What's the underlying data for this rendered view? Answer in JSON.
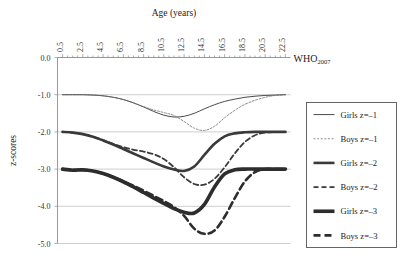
{
  "chart_data": {
    "type": "line",
    "title": "",
    "xlabel": "Age (years)",
    "ylabel": "z-scores",
    "annotation": "WHO",
    "annotation_sub": "2007",
    "xlim": [
      0,
      23
    ],
    "ylim": [
      -5.0,
      0.0
    ],
    "grid": true,
    "legend_position": "right",
    "xticklabels": [
      "0.5",
      "2.5",
      "4.5",
      "6.5",
      "8.5",
      "10.5",
      "12.5",
      "14.5",
      "16.5",
      "18.5",
      "20.5",
      "22.5"
    ],
    "xtickvalues": [
      0.5,
      2.5,
      4.5,
      6.5,
      8.5,
      10.5,
      12.5,
      14.5,
      16.5,
      18.5,
      20.5,
      22.5
    ],
    "yticklabels": [
      "0.0",
      "-1.0",
      "-2.0",
      "-3.0",
      "-4.0",
      "-5.0"
    ],
    "ytickvalues": [
      0.0,
      -1.0,
      -2.0,
      -3.0,
      -4.0,
      -5.0
    ],
    "x": [
      0.5,
      1.5,
      2.5,
      3.5,
      4.5,
      5.5,
      6.5,
      7.5,
      8.5,
      9.5,
      10.5,
      11.5,
      12.5,
      13.5,
      14.5,
      15.5,
      16.5,
      17.5,
      18.5,
      19.5,
      20.5,
      21.5,
      22.5
    ],
    "series": [
      {
        "name": "Girls z=-1",
        "color": "#4a4a4a",
        "width": 1.0,
        "dash": "none",
        "values": [
          -1.0,
          -1.0,
          -1.0,
          -1.01,
          -1.03,
          -1.07,
          -1.13,
          -1.22,
          -1.33,
          -1.45,
          -1.55,
          -1.6,
          -1.58,
          -1.5,
          -1.38,
          -1.27,
          -1.18,
          -1.12,
          -1.07,
          -1.04,
          -1.02,
          -1.01,
          -1.0
        ]
      },
      {
        "name": "Boys z=-1",
        "color": "#6f6f6f",
        "width": 0.8,
        "dash": "2,1.6",
        "values": [
          -1.0,
          -1.0,
          -1.0,
          -1.01,
          -1.03,
          -1.07,
          -1.13,
          -1.22,
          -1.32,
          -1.41,
          -1.48,
          -1.56,
          -1.72,
          -1.9,
          -1.96,
          -1.85,
          -1.62,
          -1.42,
          -1.26,
          -1.15,
          -1.07,
          -1.02,
          -1.0
        ]
      },
      {
        "name": "Girls z=-2",
        "color": "#3a3a3a",
        "width": 2.6,
        "dash": "none",
        "values": [
          -2.0,
          -2.02,
          -2.06,
          -2.13,
          -2.23,
          -2.34,
          -2.46,
          -2.58,
          -2.7,
          -2.82,
          -2.93,
          -3.01,
          -3.05,
          -2.93,
          -2.62,
          -2.32,
          -2.12,
          -2.04,
          -2.01,
          -2.0,
          -2.0,
          -2.0,
          -2.0
        ]
      },
      {
        "name": "Boys z=-2",
        "color": "#3a3a3a",
        "width": 1.8,
        "dash": "5,3",
        "values": [
          -2.0,
          -2.02,
          -2.06,
          -2.13,
          -2.22,
          -2.32,
          -2.41,
          -2.48,
          -2.53,
          -2.6,
          -2.73,
          -2.95,
          -3.22,
          -3.4,
          -3.42,
          -3.26,
          -2.95,
          -2.58,
          -2.27,
          -2.09,
          -2.02,
          -2.0,
          -2.0
        ]
      },
      {
        "name": "Girls z=-3",
        "color": "#2d2d2d",
        "width": 3.6,
        "dash": "none",
        "values": [
          -3.0,
          -3.03,
          -3.02,
          -3.05,
          -3.12,
          -3.22,
          -3.34,
          -3.48,
          -3.63,
          -3.78,
          -3.92,
          -4.06,
          -4.16,
          -4.18,
          -3.95,
          -3.48,
          -3.13,
          -3.02,
          -3.0,
          -3.0,
          -3.0,
          -3.0,
          -3.0
        ]
      },
      {
        "name": "Boys z=-3",
        "color": "#2d2d2d",
        "width": 2.6,
        "dash": "7,4",
        "values": [
          -3.0,
          -3.02,
          -3.02,
          -3.05,
          -3.12,
          -3.22,
          -3.33,
          -3.45,
          -3.58,
          -3.72,
          -3.86,
          -4.02,
          -4.26,
          -4.6,
          -4.74,
          -4.65,
          -4.28,
          -3.78,
          -3.33,
          -3.08,
          -3.0,
          -3.0,
          -3.0
        ]
      }
    ]
  },
  "legend": {
    "items": [
      {
        "label": "Girls z=–1"
      },
      {
        "label": "Boys z=–1"
      },
      {
        "label": "Girls z=–2"
      },
      {
        "label": "Boys z=–2"
      },
      {
        "label": "Girls z=–3"
      },
      {
        "label": "Boys z=–3"
      }
    ]
  }
}
